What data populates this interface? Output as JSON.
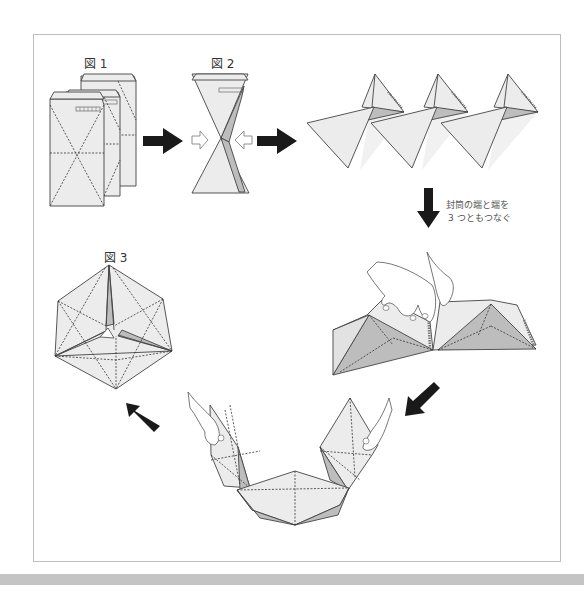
{
  "figures": {
    "fig1_label": "図 1",
    "fig2_label": "図 2",
    "fig3_label": "図 3"
  },
  "instruction": {
    "line1": "封筒の端と端を",
    "line2": "3 つともつなぐ"
  },
  "steps": [
    {
      "id": "fig1",
      "description": "Three long envelopes stacked, each with dashed X and horizontal fold lines"
    },
    {
      "id": "fig2",
      "description": "Envelope folded into hourglass shape, pressed from both sides"
    },
    {
      "id": "step3",
      "description": "Three folded envelopes forming connected triangular pyramids"
    },
    {
      "id": "step4",
      "description": "Hands joining envelope ends into a chain"
    },
    {
      "id": "step5",
      "description": "Chain curved into U-shape held by hands"
    },
    {
      "id": "fig3",
      "description": "Finished hexagonal ornament"
    }
  ],
  "colors": {
    "paper": "#ececec",
    "shade": "#bdbdbd",
    "arrow": "#1a1a1a",
    "frame_border": "#bdbdbd",
    "bottom_bar": "#c4c4c4"
  }
}
